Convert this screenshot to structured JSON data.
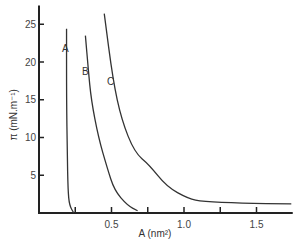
{
  "chart_data": {
    "type": "line",
    "title": "",
    "xlabel": "A (nm²)",
    "ylabel": "π (mN.m⁻¹)",
    "xlim": [
      0,
      1.75
    ],
    "ylim": [
      0,
      27
    ],
    "grid": false,
    "legend": "inline curve labels",
    "x_ticks": [
      0.25,
      0.5,
      0.75,
      1.0,
      1.25,
      1.5
    ],
    "x_tick_labels": [
      "",
      "0.5",
      "",
      "1.0",
      "",
      "1.5"
    ],
    "y_ticks": [
      5,
      10,
      15,
      20,
      25
    ],
    "y_tick_labels": [
      "5",
      "10",
      "15",
      "20",
      "25"
    ],
    "series": [
      {
        "name": "A",
        "x": [
          0.19,
          0.19,
          0.195,
          0.2,
          0.21,
          0.24
        ],
        "y": [
          24.4,
          15,
          8,
          3,
          1,
          0
        ]
      },
      {
        "name": "B",
        "x": [
          0.32,
          0.34,
          0.36,
          0.41,
          0.47,
          0.52,
          0.61,
          0.68
        ],
        "y": [
          23.5,
          19,
          15,
          10,
          6,
          3,
          1,
          0.3
        ]
      },
      {
        "name": "C",
        "x": [
          0.45,
          0.51,
          0.57,
          0.66,
          0.76,
          0.88,
          1.03,
          1.13,
          1.39,
          1.74
        ],
        "y": [
          26.4,
          17.6,
          12.3,
          8,
          6.4,
          3.5,
          1.9,
          1.5,
          1.3,
          1.2
        ]
      }
    ]
  }
}
